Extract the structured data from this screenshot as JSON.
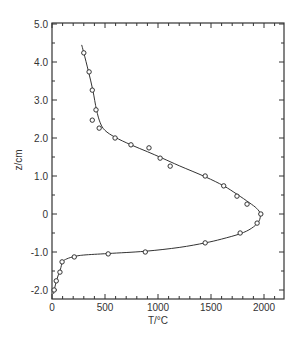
{
  "chart_data": {
    "type": "scatter",
    "title": "",
    "xlabel": "T/°C",
    "ylabel": "z/cm",
    "xlim": [
      0,
      2200
    ],
    "ylim": [
      -2.25,
      5.0
    ],
    "grid": false,
    "legend": null,
    "x_ticks": [
      0,
      500,
      1000,
      1500,
      2000
    ],
    "x_tick_labels": [
      "0",
      "500",
      "1000",
      "1500",
      "2000"
    ],
    "x_minor_step": 100,
    "y_ticks": [
      -2.0,
      -1.0,
      0,
      1.0,
      2.0,
      3.0,
      4.0,
      5.0
    ],
    "y_tick_labels": [
      "-2.0",
      "-1.0",
      "0",
      "1.0",
      "2.0",
      "3.0",
      "4.0",
      "5.0"
    ],
    "y_minor_step": 0.5,
    "series": [
      {
        "name": "measured",
        "style": "open-circle-markers",
        "points": [
          [
            300,
            4.24
          ],
          [
            350,
            3.74
          ],
          [
            380,
            3.26
          ],
          [
            415,
            2.74
          ],
          [
            380,
            2.47
          ],
          [
            445,
            2.26
          ],
          [
            595,
            2.0
          ],
          [
            745,
            1.82
          ],
          [
            915,
            1.74
          ],
          [
            1020,
            1.47
          ],
          [
            1115,
            1.26
          ],
          [
            1445,
            1.0
          ],
          [
            1620,
            0.74
          ],
          [
            1745,
            0.47
          ],
          [
            1840,
            0.26
          ],
          [
            1970,
            0.0
          ],
          [
            1935,
            -0.24
          ],
          [
            1775,
            -0.5
          ],
          [
            1445,
            -0.76
          ],
          [
            880,
            -1.0
          ],
          [
            530,
            -1.05
          ],
          [
            210,
            -1.13
          ],
          [
            95,
            -1.26
          ],
          [
            75,
            -1.53
          ],
          [
            40,
            -1.76
          ],
          [
            20,
            -2.0
          ]
        ]
      },
      {
        "name": "fit",
        "style": "solid-line",
        "points": [
          [
            280,
            4.45
          ],
          [
            300,
            4.24
          ],
          [
            345,
            3.74
          ],
          [
            385,
            3.26
          ],
          [
            420,
            2.74
          ],
          [
            455,
            2.4
          ],
          [
            500,
            2.2
          ],
          [
            595,
            2.02
          ],
          [
            745,
            1.82
          ],
          [
            900,
            1.64
          ],
          [
            1040,
            1.47
          ],
          [
            1200,
            1.27
          ],
          [
            1445,
            0.98
          ],
          [
            1620,
            0.74
          ],
          [
            1745,
            0.52
          ],
          [
            1860,
            0.3
          ],
          [
            1930,
            0.15
          ],
          [
            1965,
            0.0
          ],
          [
            1950,
            -0.2
          ],
          [
            1880,
            -0.38
          ],
          [
            1775,
            -0.52
          ],
          [
            1600,
            -0.66
          ],
          [
            1445,
            -0.76
          ],
          [
            1200,
            -0.88
          ],
          [
            880,
            -0.98
          ],
          [
            530,
            -1.04
          ],
          [
            300,
            -1.08
          ],
          [
            210,
            -1.12
          ],
          [
            140,
            -1.18
          ],
          [
            100,
            -1.26
          ],
          [
            80,
            -1.45
          ],
          [
            60,
            -1.6
          ],
          [
            40,
            -1.78
          ],
          [
            25,
            -1.95
          ],
          [
            15,
            -2.1
          ]
        ]
      }
    ]
  }
}
